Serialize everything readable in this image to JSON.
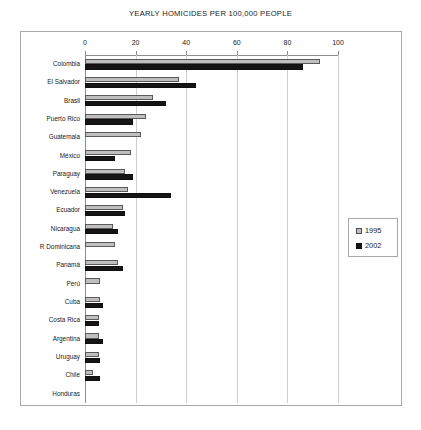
{
  "chart_data": {
    "type": "bar",
    "orientation": "horizontal",
    "title": "YEARLY HOMICIDES PER 100,000 PEOPLE",
    "xlabel": "",
    "ylabel": "",
    "xlim": [
      0,
      100
    ],
    "xticks": [
      0,
      20,
      40,
      60,
      80,
      100
    ],
    "xtick_labels": [
      "0",
      "20",
      "40",
      "60",
      "80",
      "100"
    ],
    "grid": true,
    "legend_position": "right",
    "categories": [
      "Colombia",
      "El Salvador",
      "Brasil",
      "Puerto Rico",
      "Guatemala",
      "México",
      "Paraguay",
      "Venezuela",
      "Ecuador",
      "Nicaragua",
      "R Dominicana",
      "Panamá",
      "Perú",
      "Cuba",
      "Costa Rica",
      "Argentina",
      "Uruguay",
      "Chile",
      "Honduras"
    ],
    "series": [
      {
        "name": "1995",
        "color": "#bfbfbf",
        "values": [
          93,
          37,
          27,
          24,
          22,
          18,
          16,
          17,
          15,
          11,
          12,
          13,
          6,
          6,
          5.5,
          5.5,
          5.5,
          3,
          0
        ]
      },
      {
        "name": "2002",
        "color": "#151515",
        "values": [
          86,
          44,
          32,
          19,
          0,
          12,
          19,
          34,
          16,
          13,
          0,
          15,
          0,
          7,
          5.5,
          7,
          6,
          6,
          0
        ]
      }
    ]
  },
  "legend": {
    "items": [
      {
        "label": "1995"
      },
      {
        "label": "2002"
      }
    ]
  }
}
